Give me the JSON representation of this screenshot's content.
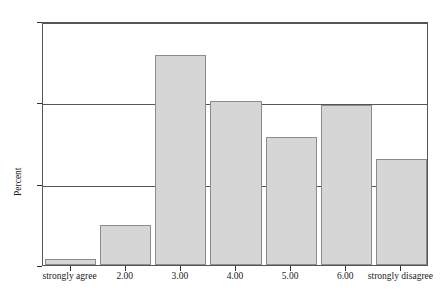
{
  "chart_data": {
    "type": "bar",
    "title": "",
    "subtitle": "",
    "xlabel": "",
    "ylabel": "Percent",
    "ylim": [
      0,
      30
    ],
    "yticks": [
      0,
      10,
      20,
      30
    ],
    "ytick_labels": [
      "0",
      "10",
      "20",
      "30"
    ],
    "grid": true,
    "legend": null,
    "categories": [
      "strongly agree",
      "2.00",
      "3.00",
      "4.00",
      "5.00",
      "6.00",
      "strongly disagree"
    ],
    "values": [
      0.7,
      4.9,
      25.8,
      20.2,
      15.7,
      19.7,
      13.0
    ],
    "bar_fill_color": "#d6d6d6",
    "bar_edge_color": "#8c8c8c",
    "axis_color": "#555555",
    "text_color": "#1a1a1a",
    "background_color": "#ffffff"
  }
}
